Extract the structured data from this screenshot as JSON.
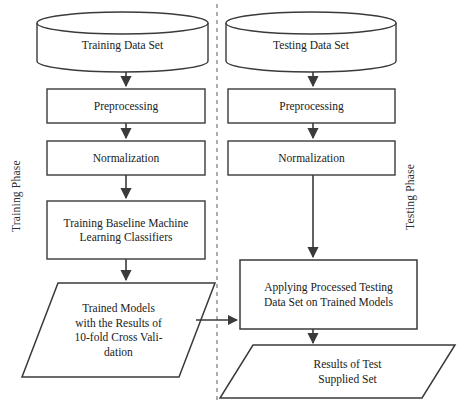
{
  "diagram": {
    "background_color": "#ffffff",
    "stroke_color": "#3a3a3a",
    "text_color": "#1a1a1a",
    "divider": {
      "name": "phase-divider",
      "style": "dashed",
      "x": 217,
      "y_start": 4,
      "y_end": 400
    },
    "phases": [
      {
        "id": "training",
        "label": "Training Phase",
        "side": "left"
      },
      {
        "id": "testing",
        "label": "Testing Phase",
        "side": "right"
      }
    ],
    "nodes": [
      {
        "id": "training_data_set",
        "label": "Training Data Set",
        "shape": "cylinder",
        "column": "training",
        "x": 37,
        "y": 13,
        "w": 171,
        "h": 58
      },
      {
        "id": "training_preprocessing",
        "label": "Preprocessing",
        "shape": "rect",
        "column": "training",
        "x": 47,
        "y": 89,
        "w": 158,
        "h": 34
      },
      {
        "id": "training_normalization",
        "label": "Normalization",
        "shape": "rect",
        "column": "training",
        "x": 47,
        "y": 141,
        "w": 158,
        "h": 34
      },
      {
        "id": "training_classifiers",
        "label": "Training Baseline Machine\nLearning Classifiers",
        "shape": "rect",
        "column": "training",
        "x": 47,
        "y": 201,
        "w": 158,
        "h": 58
      },
      {
        "id": "trained_models",
        "label": "Trained Models\nwith the Results of\n10-fold Cross Vali-\ndation",
        "shape": "parallelogram",
        "column": "training",
        "x": 22,
        "y": 283,
        "w": 193,
        "h": 94
      },
      {
        "id": "testing_data_set",
        "label": "Testing Data Set",
        "shape": "cylinder",
        "column": "testing",
        "x": 226,
        "y": 13,
        "w": 170,
        "h": 58
      },
      {
        "id": "testing_preprocessing",
        "label": "Preprocessing",
        "shape": "rect",
        "column": "testing",
        "x": 228,
        "y": 89,
        "w": 167,
        "h": 34
      },
      {
        "id": "testing_normalization",
        "label": "Normalization",
        "shape": "rect",
        "column": "testing",
        "x": 228,
        "y": 141,
        "w": 167,
        "h": 34
      },
      {
        "id": "applying_processed",
        "label": "Applying Processed Testing\nData Set on Trained Models",
        "shape": "rect",
        "column": "testing",
        "x": 240,
        "y": 260,
        "w": 177,
        "h": 69
      },
      {
        "id": "results_of_test",
        "label": "Results of Test\nSupplied Set",
        "shape": "parallelogram",
        "column": "testing",
        "x": 220,
        "y": 345,
        "w": 235,
        "h": 53
      }
    ],
    "edges": [
      {
        "id": "e1",
        "from": "training_data_set",
        "to": "training_preprocessing",
        "direction": "down"
      },
      {
        "id": "e2",
        "from": "training_preprocessing",
        "to": "training_normalization",
        "direction": "down"
      },
      {
        "id": "e3",
        "from": "training_normalization",
        "to": "training_classifiers",
        "direction": "down"
      },
      {
        "id": "e4",
        "from": "training_classifiers",
        "to": "trained_models",
        "direction": "down"
      },
      {
        "id": "e5",
        "from": "trained_models",
        "to": "applying_processed",
        "direction": "right"
      },
      {
        "id": "e6",
        "from": "testing_data_set",
        "to": "testing_preprocessing",
        "direction": "down"
      },
      {
        "id": "e7",
        "from": "testing_preprocessing",
        "to": "testing_normalization",
        "direction": "down"
      },
      {
        "id": "e8",
        "from": "testing_normalization",
        "to": "applying_processed",
        "direction": "down"
      },
      {
        "id": "e9",
        "from": "applying_processed",
        "to": "results_of_test",
        "direction": "down"
      }
    ]
  }
}
